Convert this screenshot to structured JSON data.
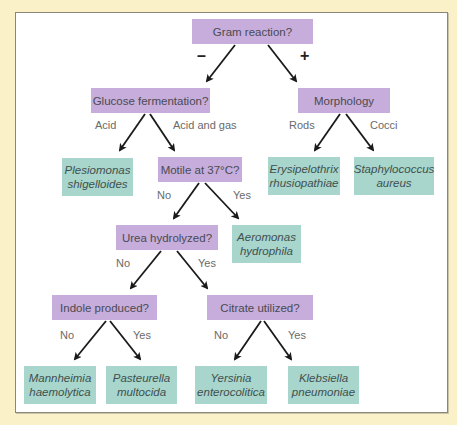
{
  "diagram": {
    "type": "decision-tree",
    "nodes": {
      "root": "Gram reaction?",
      "glucose": "Glucose fermentation?",
      "morphology": "Morphology",
      "plesiomonas": [
        "Plesiomonas",
        "shigelloides"
      ],
      "motile": "Motile at 37°C?",
      "erysipelothrix": [
        "Erysipelothrix",
        "rhusiopathiae"
      ],
      "staphylococcus": [
        "Staphylococcus",
        "aureus"
      ],
      "urea": "Urea hydrolyzed?",
      "aeromonas": [
        "Aeromonas",
        "hydrophila"
      ],
      "indole": "Indole produced?",
      "citrate": "Citrate utilized?",
      "mannheimia": [
        "Mannheimia",
        "haemolytica"
      ],
      "pasteurella": [
        "Pasteurella",
        "multocida"
      ],
      "yersinia": [
        "Yersinia",
        "enterocolitica"
      ],
      "klebsiella": [
        "Klebsiella",
        "pneumoniae"
      ]
    },
    "edge_labels": {
      "root_neg": "–",
      "root_pos": "+",
      "glucose_acid": "Acid",
      "glucose_acid_gas": "Acid and gas",
      "morph_rods": "Rods",
      "morph_cocci": "Cocci",
      "motile_no": "No",
      "motile_yes": "Yes",
      "urea_no": "No",
      "urea_yes": "Yes",
      "indole_no": "No",
      "indole_yes": "Yes",
      "citrate_no": "No",
      "citrate_yes": "Yes"
    },
    "colors": {
      "question_box": "#c6addb",
      "answer_box": "#a8d5cc",
      "background": "#fbf1c9",
      "arrow": "#1a1a1a"
    }
  }
}
